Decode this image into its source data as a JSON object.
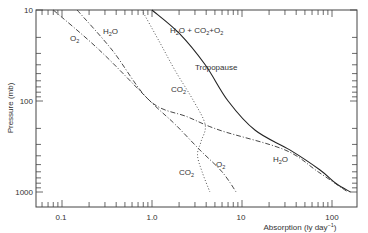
{
  "chart_data": {
    "type": "line",
    "title": "",
    "xlabel": "Absorption (ly day⁻¹)",
    "ylabel": "Pressure (mb)",
    "xscale": "log",
    "yscale": "log",
    "yinverted": true,
    "xlim": [
      0.053,
      190
    ],
    "ylim": [
      10,
      1450
    ],
    "grid": false,
    "legend": "inline labels",
    "x_ticks": [
      {
        "value": 0.1,
        "label": "0.1"
      },
      {
        "value": 1.0,
        "label": "1.0"
      },
      {
        "value": 10,
        "label": "10"
      },
      {
        "value": 100,
        "label": "100"
      }
    ],
    "y_ticks": [
      {
        "value": 10,
        "label": "10"
      },
      {
        "value": 100,
        "label": "100"
      },
      {
        "value": 1000,
        "label": "1000"
      }
    ],
    "series": [
      {
        "name": "H2O + CO2 + O2",
        "style": "solid",
        "points": [
          [
            1.0,
            10
          ],
          [
            2.0,
            18
          ],
          [
            3.9,
            40
          ],
          [
            7.0,
            100
          ],
          [
            14,
            210
          ],
          [
            34,
            345
          ],
          [
            73,
            570
          ],
          [
            110,
            800
          ],
          [
            160,
            1000
          ]
        ]
      },
      {
        "name": "H2O",
        "style": "dashdot",
        "points": [
          [
            0.147,
            10
          ],
          [
            0.36,
            27.5
          ],
          [
            0.95,
            100
          ],
          [
            2.5,
            150
          ],
          [
            5.7,
            210
          ],
          [
            30,
            345
          ],
          [
            70,
            600
          ],
          [
            150,
            1000
          ]
        ]
      },
      {
        "name": "O2",
        "style": "dashdot",
        "points": [
          [
            0.08,
            10
          ],
          [
            0.26,
            27.5
          ],
          [
            0.95,
            100
          ],
          [
            1.8,
            180
          ],
          [
            3.4,
            345
          ],
          [
            6.0,
            600
          ],
          [
            8.6,
            1000
          ]
        ]
      },
      {
        "name": "CO2",
        "style": "dotted",
        "points": [
          [
            0.77,
            10
          ],
          [
            1.2,
            22
          ],
          [
            1.8,
            46
          ],
          [
            2.9,
            100
          ],
          [
            3.9,
            183
          ],
          [
            3.5,
            280
          ],
          [
            3.2,
            390
          ],
          [
            3.6,
            600
          ],
          [
            4.4,
            1000
          ]
        ]
      }
    ],
    "annotations": [
      {
        "text": "H2O + CO2 + O2",
        "x": 2.1,
        "y": 15
      },
      {
        "text": "Tropopause",
        "x": 2.6,
        "y": 35
      },
      {
        "text": "H2O",
        "x": 0.33,
        "y": 14
      },
      {
        "text": "O2",
        "x": 0.115,
        "y": 18
      },
      {
        "text": "CO2",
        "x": 1.35,
        "y": 90
      },
      {
        "text": "CO2",
        "x": 1.9,
        "y": 540
      },
      {
        "text": "O2",
        "x": 3.7,
        "y": 480
      },
      {
        "text": "H2O",
        "x": 32,
        "y": 450
      }
    ]
  },
  "labels": {
    "xlabel": "Absorption (ly day",
    "xlabel_sup": "−1",
    "xlabel_end": ")",
    "ylabel": "Pressure (mb)",
    "x_tick_labels": [
      "0.1",
      "1.0",
      "10",
      "100"
    ],
    "y_tick_labels": [
      "10",
      "100",
      "1000"
    ],
    "total_label_parts": [
      "H",
      "2",
      "O + CO",
      "2",
      "+O",
      "2"
    ],
    "tropopause": "Tropopause",
    "h2o_top": [
      "H",
      "2",
      "O"
    ],
    "o2_top": [
      "O",
      "2"
    ],
    "co2_mid": [
      "CO",
      "2"
    ],
    "co2_low": [
      "CO",
      "2"
    ],
    "o2_low": [
      "O",
      "2"
    ],
    "h2o_low": [
      "H",
      "2",
      "O"
    ]
  }
}
